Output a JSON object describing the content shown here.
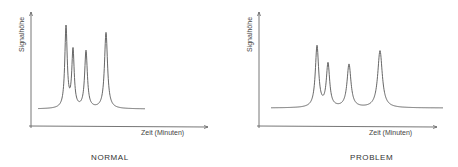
{
  "chart_data": [
    {
      "type": "line",
      "title": "NORMAL",
      "xlabel": "Zeit (Minuten)",
      "ylabel": "Signalhöhe",
      "grid": false,
      "axes": {
        "y_axis_x": 31,
        "x_axis_y": 126,
        "x_start": 29,
        "x_end": 208,
        "y_top": 12
      },
      "baseline": {
        "y": 109,
        "x_start": 38,
        "x_end": 145
      },
      "peaks": [
        {
          "x": 66,
          "top": 28,
          "width": 1.6
        },
        {
          "x": 73,
          "top": 52,
          "width": 1.6
        },
        {
          "x": 86,
          "top": 52,
          "width": 1.8
        },
        {
          "x": 106,
          "top": 33,
          "width": 2.0
        }
      ],
      "description": "Sharp, narrow chromatographic peaks, well resolved"
    },
    {
      "type": "line",
      "title": "PROBLEM",
      "xlabel": "Zeit (Minuten)",
      "ylabel": "Signalhöhe",
      "grid": false,
      "axes": {
        "y_axis_x": 259,
        "x_axis_y": 126,
        "x_start": 257,
        "x_end": 437,
        "y_top": 12
      },
      "baseline": {
        "y": 108,
        "x_start": 271,
        "x_end": 443
      },
      "peaks": [
        {
          "x": 317,
          "top": 47,
          "width": 2.2
        },
        {
          "x": 328,
          "top": 65,
          "width": 2.2
        },
        {
          "x": 349,
          "top": 65,
          "width": 2.6
        },
        {
          "x": 380,
          "top": 51,
          "width": 3.0
        }
      ],
      "description": "Lower, broader peaks with tailing at base"
    }
  ],
  "labels": {
    "left": {
      "title": "NORMAL",
      "xlabel": "Zeit (Minuten)",
      "ylabel": "Signalhöhe"
    },
    "right": {
      "title": "PROBLEM",
      "xlabel": "Zeit (Minuten)",
      "ylabel": "Signalhöhe"
    }
  },
  "colors": {
    "line": "#555555",
    "axis": "#666666",
    "text": "#333333"
  }
}
